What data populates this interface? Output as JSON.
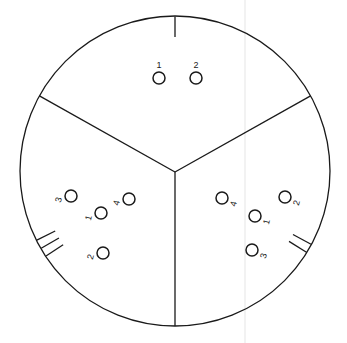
{
  "figure": {
    "background_color": "#ffffff",
    "stroke_color": "#1a1a1a",
    "label_color": "#1a1a1a",
    "artifact_color": "#ededed",
    "outer_circle": {
      "cx": 175,
      "cy": 171,
      "r": 155
    },
    "center_junction": {
      "x": 175,
      "y": 172
    }
  },
  "sectors": [
    {
      "id": "top",
      "name": "top-sector",
      "tick_count": 1,
      "tick_angle_deg": 270,
      "nodes": [
        {
          "label": "1",
          "cx": 159,
          "cy": 78,
          "r": 6,
          "label_x": 159,
          "label_y": 66,
          "label_rotation": 0
        },
        {
          "label": "2",
          "cx": 196,
          "cy": 78,
          "r": 6,
          "label_x": 196,
          "label_y": 66,
          "label_rotation": 0
        }
      ]
    },
    {
      "id": "bottom-left",
      "name": "bottom-left-sector",
      "tick_count": 3,
      "tick_angle_deg": 150,
      "nodes": [
        {
          "label": "3",
          "cx": 71,
          "cy": 196,
          "r": 6,
          "label_x": 59,
          "label_y": 200,
          "label_rotation": -75
        },
        {
          "label": "4",
          "cx": 129,
          "cy": 199,
          "r": 6,
          "label_x": 117,
          "label_y": 203,
          "label_rotation": -75
        },
        {
          "label": "1",
          "cx": 101,
          "cy": 213,
          "r": 6,
          "label_x": 89,
          "label_y": 218,
          "label_rotation": -75
        },
        {
          "label": "2",
          "cx": 103,
          "cy": 253,
          "r": 6,
          "label_x": 91,
          "label_y": 257,
          "label_rotation": -75
        }
      ]
    },
    {
      "id": "bottom-right",
      "name": "bottom-right-sector",
      "tick_count": 2,
      "tick_angle_deg": 30,
      "nodes": [
        {
          "label": "4",
          "cx": 222,
          "cy": 198,
          "r": 6,
          "label_x": 234,
          "label_y": 204,
          "label_rotation": -75
        },
        {
          "label": "2",
          "cx": 285,
          "cy": 197,
          "r": 6,
          "label_x": 297,
          "label_y": 203,
          "label_rotation": -75
        },
        {
          "label": "1",
          "cx": 255,
          "cy": 216,
          "r": 6,
          "label_x": 267,
          "label_y": 222,
          "label_rotation": -75
        },
        {
          "label": "3",
          "cx": 252,
          "cy": 250,
          "r": 6,
          "label_x": 264,
          "label_y": 256,
          "label_rotation": -75
        }
      ]
    }
  ],
  "dividers": [
    {
      "name": "divider-down",
      "angle_deg": 90,
      "from": "center",
      "to": "rim"
    },
    {
      "name": "divider-upper-left",
      "angle_deg": 209,
      "from": "center",
      "to": "rim"
    },
    {
      "name": "divider-upper-right",
      "angle_deg": 331,
      "from": "center",
      "to": "rim"
    }
  ],
  "artifacts": [
    {
      "name": "vertical-scan-line",
      "x": 245,
      "y1": 0,
      "y2": 343
    }
  ]
}
